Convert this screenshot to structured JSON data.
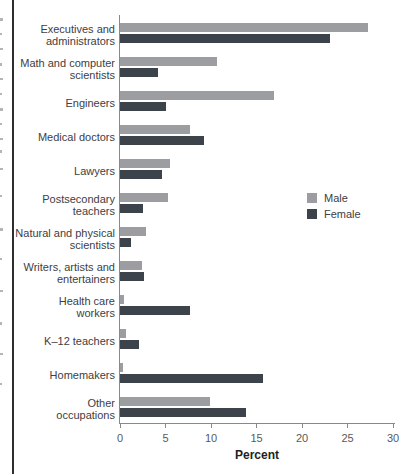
{
  "chart_data": {
    "type": "bar",
    "orientation": "horizontal",
    "title": "",
    "xlabel": "Percent",
    "xlim": [
      0,
      30
    ],
    "xticks": [
      0,
      5,
      10,
      15,
      20,
      25,
      30
    ],
    "grid": false,
    "legend_position": "middle-right",
    "categories": [
      "Executives and administrators",
      "Math and computer scientists",
      "Engineers",
      "Medical doctors",
      "Lawyers",
      "Postsecondary teachers",
      "Natural and physical scientists",
      "Writers, artists and entertainers",
      "Health care workers",
      "K–12 teachers",
      "Homemakers",
      "Other occupations"
    ],
    "categories_display": [
      "Executives and\nadministrators",
      "Math and computer\nscientists",
      "Engineers",
      "Medical doctors",
      "Lawyers",
      "Postsecondary\nteachers",
      "Natural and physical\nscientists",
      "Writers, artists and\nentertainers",
      "Health care\nworkers",
      "K–12 teachers",
      "Homemakers",
      "Other\noccupations"
    ],
    "series": [
      {
        "name": "Male",
        "color": "#9b9da0",
        "values": [
          27.2,
          10.7,
          16.9,
          7.7,
          5.5,
          5.3,
          2.9,
          2.4,
          0.4,
          0.7,
          0.3,
          9.9
        ]
      },
      {
        "name": "Female",
        "color": "#3d434b",
        "values": [
          23.1,
          4.2,
          5.1,
          9.2,
          4.6,
          2.5,
          1.2,
          2.6,
          7.7,
          2.1,
          15.7,
          13.8
        ]
      }
    ],
    "colors": {
      "axis": "#87898c",
      "tick_label": "#58595b",
      "category_label": "#414042",
      "axis_title": "#231f20"
    }
  }
}
